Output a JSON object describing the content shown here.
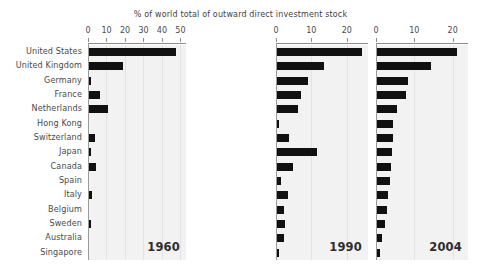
{
  "chart_data": {
    "type": "bar",
    "title": "% of world total of outward direct investment stock",
    "xlabel": "",
    "ylabel": "",
    "orientation": "horizontal",
    "grid": true,
    "legend_position": "none",
    "categories": [
      "United States",
      "United Kingdom",
      "Germany",
      "France",
      "Netherlands",
      "Hong Kong",
      "Switzerland",
      "Japan",
      "Canada",
      "Spain",
      "Italy",
      "Belgium",
      "Sweden",
      "Australia",
      "Singapore"
    ],
    "panels": [
      {
        "name": "1960",
        "label": "1960",
        "xlim": [
          0,
          53
        ],
        "ticks": [
          0,
          10,
          20,
          30,
          40,
          50
        ],
        "tick_labels": [
          "0",
          "10",
          "20",
          "30",
          "40",
          "50"
        ],
        "values": [
          47.1,
          18.3,
          1.2,
          6.1,
          10.3,
          0.0,
          3.4,
          0.7,
          3.7,
          0.0,
          1.6,
          0.0,
          0.4,
          0.0,
          0.0
        ]
      },
      {
        "name": "1990",
        "label": "1990",
        "xlim": [
          0,
          26
        ],
        "ticks": [
          0,
          10,
          20
        ],
        "tick_labels": [
          "0",
          "10",
          "20"
        ],
        "values": [
          24.0,
          13.3,
          8.8,
          6.7,
          6.0,
          0.5,
          3.4,
          11.2,
          4.6,
          1.1,
          3.1,
          1.9,
          2.4,
          1.9,
          0.4
        ]
      },
      {
        "name": "2004",
        "label": "2004",
        "xlim": [
          0,
          24
        ],
        "ticks": [
          0,
          10,
          20
        ],
        "tick_labels": [
          "0",
          "10",
          "20"
        ],
        "values": [
          20.8,
          14.1,
          8.0,
          7.6,
          5.2,
          4.3,
          4.1,
          3.8,
          3.6,
          3.3,
          2.9,
          2.6,
          2.1,
          1.3,
          0.7
        ]
      }
    ]
  },
  "colors": {
    "bar": "#111111",
    "panel_background": "#f2f2f2",
    "gridline": "#e2e2e2",
    "axis": "#8d8d8d",
    "text": "#4a4a4a"
  }
}
